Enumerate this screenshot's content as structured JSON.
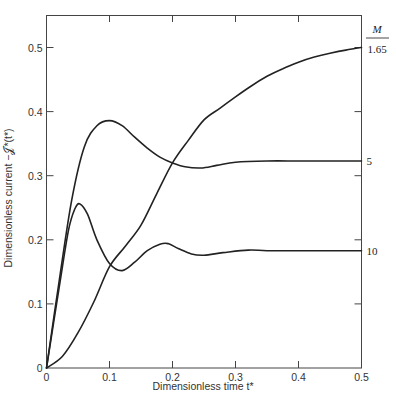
{
  "chart_data": {
    "type": "line",
    "title": "",
    "xlabel": "Dimensionless time t*",
    "ylabel": "Dimensionless current −𝒥*(t*)",
    "xlim": [
      0,
      0.5
    ],
    "ylim": [
      0,
      0.55
    ],
    "xticks": [
      0,
      0.1,
      0.2,
      0.3,
      0.4,
      0.5
    ],
    "xtick_labels": [
      "0",
      "0.1",
      "0.2",
      "0.3",
      "0.4",
      "0.5"
    ],
    "yticks": [
      0,
      0.1,
      0.2,
      0.3,
      0.4,
      0.5
    ],
    "ytick_labels": [
      "0",
      "0.1",
      "0.2",
      "0.3",
      "0.4",
      "0.5"
    ],
    "grid": false,
    "legend": "curve labels on right axis",
    "right_axis_label": "M",
    "series": [
      {
        "name": "M = 1.65",
        "label": "1.65",
        "x": [
          0,
          0.025,
          0.05,
          0.075,
          0.1,
          0.125,
          0.15,
          0.175,
          0.2,
          0.225,
          0.25,
          0.275,
          0.3,
          0.325,
          0.35,
          0.375,
          0.4,
          0.425,
          0.45,
          0.475,
          0.5
        ],
        "y": [
          0,
          0.018,
          0.055,
          0.103,
          0.158,
          0.19,
          0.223,
          0.272,
          0.32,
          0.355,
          0.387,
          0.405,
          0.423,
          0.44,
          0.455,
          0.467,
          0.477,
          0.485,
          0.491,
          0.496,
          0.5
        ]
      },
      {
        "name": "M = 5",
        "label": "5",
        "x": [
          0,
          0.02,
          0.04,
          0.06,
          0.08,
          0.1,
          0.12,
          0.14,
          0.16,
          0.18,
          0.2,
          0.22,
          0.245,
          0.27,
          0.3,
          0.35,
          0.4,
          0.45,
          0.5
        ],
        "y": [
          0,
          0.135,
          0.262,
          0.345,
          0.378,
          0.386,
          0.378,
          0.36,
          0.343,
          0.329,
          0.32,
          0.314,
          0.312,
          0.316,
          0.321,
          0.323,
          0.323,
          0.323,
          0.323
        ]
      },
      {
        "name": "M = 10",
        "label": "10",
        "x": [
          0,
          0.02,
          0.035,
          0.045,
          0.053,
          0.065,
          0.08,
          0.1,
          0.12,
          0.14,
          0.16,
          0.18,
          0.193,
          0.21,
          0.23,
          0.25,
          0.28,
          0.32,
          0.35,
          0.4,
          0.45,
          0.5
        ],
        "y": [
          0,
          0.125,
          0.215,
          0.248,
          0.256,
          0.24,
          0.2,
          0.163,
          0.152,
          0.165,
          0.183,
          0.193,
          0.194,
          0.186,
          0.178,
          0.176,
          0.18,
          0.184,
          0.183,
          0.183,
          0.183,
          0.183
        ]
      }
    ]
  }
}
